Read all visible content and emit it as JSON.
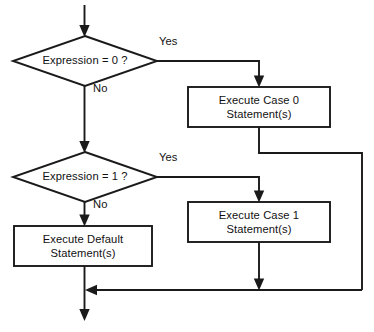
{
  "diagram": {
    "type": "flowchart",
    "background_color": "#ffffff",
    "stroke_color": "#1a1a1a",
    "text_color": "#111111",
    "nodes": [
      {
        "id": "decision-expression-0",
        "shape": "diamond",
        "label": "Expression = 0 ?",
        "cx": 85,
        "cy": 61,
        "half_width": 72,
        "half_height": 25
      },
      {
        "id": "process-case-0",
        "shape": "rectangle",
        "label_line1": "Execute Case 0",
        "label_line2": "Statement(s)",
        "x": 188,
        "y": 87,
        "width": 142,
        "height": 40
      },
      {
        "id": "decision-expression-1",
        "shape": "diamond",
        "label": "Expression = 1 ?",
        "cx": 85,
        "cy": 177,
        "half_width": 72,
        "half_height": 25
      },
      {
        "id": "process-case-1",
        "shape": "rectangle",
        "label_line1": "Execute Case 1",
        "label_line2": "Statement(s)",
        "x": 188,
        "y": 202,
        "width": 142,
        "height": 40
      },
      {
        "id": "process-default",
        "shape": "rectangle",
        "label_line1": "Execute Default",
        "label_line2": "Statement(s)",
        "x": 14,
        "y": 226,
        "width": 138,
        "height": 40
      }
    ],
    "edge_labels": [
      {
        "id": "yes-0",
        "text": "Yes",
        "x": 159,
        "y": 42
      },
      {
        "id": "no-0",
        "text": "No",
        "x": 93,
        "y": 89
      },
      {
        "id": "yes-1",
        "text": "Yes",
        "x": 159,
        "y": 158
      },
      {
        "id": "no-1",
        "text": "No",
        "x": 93,
        "y": 205
      }
    ],
    "edges": [
      {
        "id": "entry-to-decision-0",
        "from": "entry",
        "to": "decision-expression-0"
      },
      {
        "id": "decision-0-yes-to-case-0",
        "from": "decision-expression-0",
        "to": "process-case-0",
        "label": "Yes"
      },
      {
        "id": "decision-0-no-to-decision-1",
        "from": "decision-expression-0",
        "to": "decision-expression-1",
        "label": "No"
      },
      {
        "id": "case-0-to-merge",
        "from": "process-case-0",
        "to": "merge"
      },
      {
        "id": "decision-1-yes-to-case-1",
        "from": "decision-expression-1",
        "to": "process-case-1",
        "label": "Yes"
      },
      {
        "id": "decision-1-no-to-default",
        "from": "decision-expression-1",
        "to": "process-default",
        "label": "No"
      },
      {
        "id": "case-1-to-merge",
        "from": "process-case-1",
        "to": "merge"
      },
      {
        "id": "default-to-exit",
        "from": "process-default",
        "to": "exit"
      }
    ]
  }
}
